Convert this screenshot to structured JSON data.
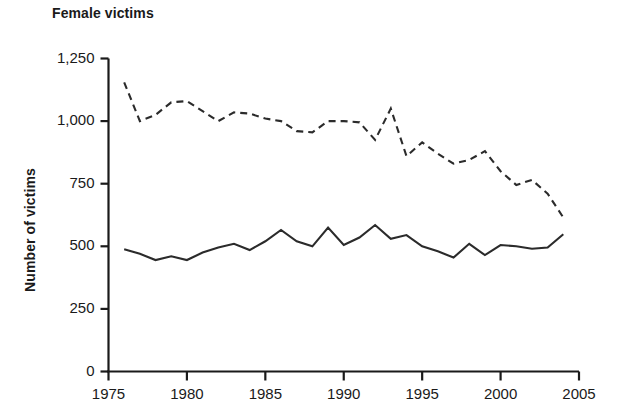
{
  "chart_data": {
    "type": "line",
    "title": "Female victims",
    "xlabel": "",
    "ylabel": "Number of victims",
    "xlim": [
      1975,
      2005
    ],
    "ylim": [
      0,
      1250
    ],
    "grid": false,
    "legend": "none",
    "xticks": [
      "1975",
      "1980",
      "1985",
      "1990",
      "1995",
      "2000",
      "2005"
    ],
    "xtick_values": [
      1975,
      1980,
      1985,
      1990,
      1995,
      2000,
      2005
    ],
    "yticks": [
      "0",
      "250",
      "500",
      "750",
      "1,000",
      "1,250"
    ],
    "ytick_values": [
      0,
      250,
      500,
      750,
      1000,
      1250
    ],
    "x": [
      1976,
      1977,
      1978,
      1979,
      1980,
      1981,
      1982,
      1983,
      1984,
      1985,
      1986,
      1987,
      1988,
      1989,
      1990,
      1991,
      1992,
      1993,
      1994,
      1995,
      1996,
      1997,
      1998,
      1999,
      2000,
      2001,
      2002,
      2003,
      2004
    ],
    "series": [
      {
        "name": "Intimate partner (dashed)",
        "style": "dashed",
        "color": "#2b2b2b",
        "values": [
          1155,
          1000,
          1025,
          1075,
          1080,
          1040,
          1000,
          1035,
          1030,
          1010,
          1000,
          960,
          955,
          1000,
          1000,
          995,
          925,
          1050,
          860,
          915,
          870,
          830,
          845,
          880,
          800,
          745,
          765,
          710,
          615
        ]
      },
      {
        "name": "Other victims (solid)",
        "style": "solid",
        "color": "#2b2b2b",
        "values": [
          488,
          470,
          445,
          460,
          445,
          475,
          495,
          510,
          485,
          520,
          565,
          520,
          500,
          575,
          505,
          535,
          585,
          530,
          545,
          500,
          480,
          455,
          510,
          465,
          505,
          500,
          490,
          495,
          548
        ]
      }
    ]
  }
}
